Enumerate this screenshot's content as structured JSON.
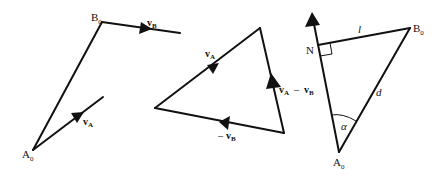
{
  "diagrams": [
    {
      "name": "relative-position",
      "labels": {
        "a0": "A",
        "a0_sub": "0",
        "b0": "B",
        "b0_sub": "0",
        "va": "v",
        "va_sub": "A",
        "vb": "v",
        "vb_sub": "B"
      }
    },
    {
      "name": "velocity-triangle",
      "labels": {
        "va": "v",
        "va_sub": "A",
        "diff_v1": "v",
        "diff_v1_sub": "A",
        "diff_minus": "–",
        "diff_v2": "v",
        "diff_v2_sub": "B",
        "neg_minus": "–",
        "neg_v": "v",
        "neg_v_sub": "B"
      }
    },
    {
      "name": "closest-approach",
      "labels": {
        "a0": "A",
        "a0_sub": "0",
        "b0": "B",
        "b0_sub": "0",
        "n": "N",
        "l": "l",
        "d": "d",
        "alpha": "α"
      }
    }
  ],
  "colors": {
    "line": "#111111",
    "background": "#ffffff"
  }
}
